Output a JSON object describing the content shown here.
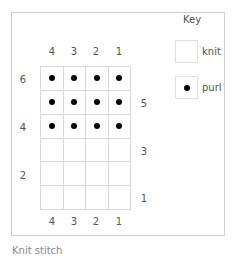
{
  "chart": {
    "type": "knitting-chart",
    "top_col_labels": [
      "4",
      "3",
      "2",
      "1"
    ],
    "bottom_col_labels": [
      "4",
      "3",
      "2",
      "1"
    ],
    "left_row_labels": [
      {
        "label": "6",
        "row": 6
      },
      {
        "label": "4",
        "row": 4
      },
      {
        "label": "2",
        "row": 2
      }
    ],
    "right_row_labels": [
      {
        "label": "5",
        "row": 5
      },
      {
        "label": "3",
        "row": 3
      },
      {
        "label": "1",
        "row": 1
      }
    ],
    "rows_top_to_bottom": [
      [
        "purl",
        "purl",
        "purl",
        "purl"
      ],
      [
        "purl",
        "purl",
        "purl",
        "purl"
      ],
      [
        "purl",
        "purl",
        "purl",
        "purl"
      ],
      [
        "knit",
        "knit",
        "knit",
        "knit"
      ],
      [
        "knit",
        "knit",
        "knit",
        "knit"
      ],
      [
        "knit",
        "knit",
        "knit",
        "knit"
      ]
    ]
  },
  "key": {
    "title": "Key",
    "items": [
      {
        "symbol": "empty-square",
        "label": "knit"
      },
      {
        "symbol": "dot",
        "label": "purl"
      }
    ]
  },
  "caption": "Knit stitch"
}
